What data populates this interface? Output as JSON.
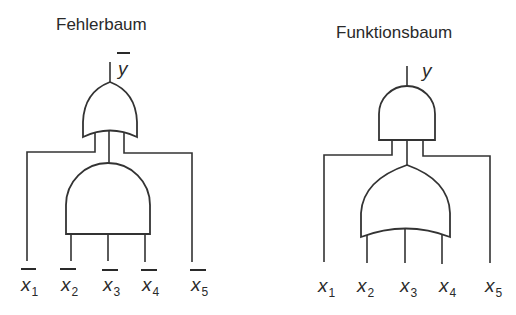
{
  "left_diagram": {
    "title": "Fehlerbaum",
    "output": {
      "symbol": "y",
      "negated": true
    },
    "top_gate": "OR",
    "inner_gate": "AND",
    "inputs": [
      {
        "symbol": "x",
        "index": "1",
        "negated": true
      },
      {
        "symbol": "x",
        "index": "2",
        "negated": true
      },
      {
        "symbol": "x",
        "index": "3",
        "negated": true
      },
      {
        "symbol": "x",
        "index": "4",
        "negated": true
      },
      {
        "symbol": "x",
        "index": "5",
        "negated": true
      }
    ]
  },
  "right_diagram": {
    "title": "Funktionsbaum",
    "output": {
      "symbol": "y",
      "negated": false
    },
    "top_gate": "AND",
    "inner_gate": "OR",
    "inputs": [
      {
        "symbol": "x",
        "index": "1",
        "negated": false
      },
      {
        "symbol": "x",
        "index": "2",
        "negated": false
      },
      {
        "symbol": "x",
        "index": "3",
        "negated": false
      },
      {
        "symbol": "x",
        "index": "4",
        "negated": false
      },
      {
        "symbol": "x",
        "index": "5",
        "negated": false
      }
    ]
  },
  "colors": {
    "line": "#333333",
    "text": "#2a2a2a",
    "background": "#ffffff"
  }
}
